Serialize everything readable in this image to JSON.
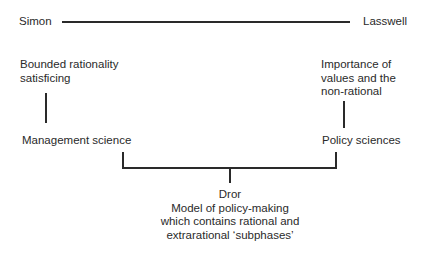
{
  "nodes": {
    "simon": "Simon",
    "lasswell": "Lasswell",
    "left_desc": [
      "Bounded rationality",
      "satisficing"
    ],
    "right_desc": [
      "Importance of",
      "values and the",
      "non-rational"
    ],
    "left_field": "Management science",
    "right_field": "Policy sciences",
    "dror": {
      "title": "Dror",
      "lines": [
        "Model of policy-making",
        "which contains rational and",
        "extrarational ‘subphases’"
      ]
    }
  }
}
